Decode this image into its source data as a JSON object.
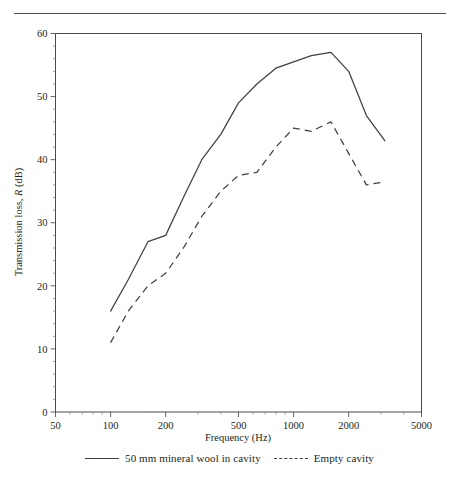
{
  "figure": {
    "top_rule": "horizontal-rule"
  },
  "legend": {
    "entries": [
      {
        "label": "50 mm mineral wool in cavity",
        "style": "solid",
        "marker": "solid-line-swatch"
      },
      {
        "label": "Empty cavity",
        "style": "dashed",
        "marker": "dashed-line-swatch"
      }
    ]
  },
  "chart_data": {
    "type": "line",
    "title": "",
    "xlabel": "Frequency (Hz)",
    "ylabel": "Transmission loss, R (dB)",
    "xscale": "log",
    "xlim": [
      50,
      5000
    ],
    "ylim": [
      0,
      60
    ],
    "xticks": [
      50,
      100,
      200,
      500,
      1000,
      2000,
      5000
    ],
    "xticklabels": [
      "50",
      "100",
      "200",
      "500",
      "1000",
      "2000",
      "5000"
    ],
    "yticks": [
      0,
      10,
      20,
      30,
      40,
      50,
      60
    ],
    "yticklabels": [
      "0",
      "10",
      "20",
      "30",
      "40",
      "50",
      "60"
    ],
    "yminor_step": 2,
    "grid": false,
    "legend_position": "below-axes",
    "x": [
      100,
      125,
      160,
      200,
      250,
      315,
      400,
      500,
      630,
      800,
      1000,
      1250,
      1600,
      2000,
      2500,
      3150
    ],
    "series": [
      {
        "name": "50 mm mineral wool in cavity",
        "style": "solid",
        "values": [
          16,
          21,
          27,
          28,
          34,
          40,
          44,
          49,
          52,
          54.5,
          55.5,
          56.5,
          57,
          54,
          47,
          43
        ]
      },
      {
        "name": "Empty cavity",
        "style": "dashed",
        "values": [
          11,
          16,
          20,
          22,
          26,
          31,
          35,
          37.5,
          38,
          42,
          45,
          44.5,
          46,
          41,
          36,
          36.5
        ]
      }
    ]
  }
}
